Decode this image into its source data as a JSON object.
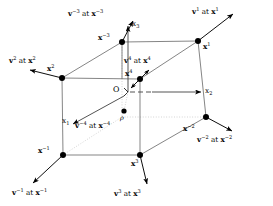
{
  "figure": {
    "background_color": "#ffffff",
    "line_color": "#000000",
    "dotted_color": "#bdbdbd",
    "node_color": "#000000"
  },
  "axes": [
    {
      "id": "x1",
      "label_text": "x",
      "label_sub": "1"
    },
    {
      "id": "x2",
      "label_text": "x",
      "label_sub": "2"
    },
    {
      "id": "x3",
      "label_text": "x",
      "label_sub": "3"
    }
  ],
  "origin": {
    "label": "O"
  },
  "position_vector": {
    "label": "ρ"
  },
  "nodes": [
    {
      "id": "n_x1",
      "base": "x",
      "exp": "1"
    },
    {
      "id": "n_x2",
      "base": "x",
      "exp": "2"
    },
    {
      "id": "n_x3",
      "base": "x",
      "exp": "3"
    },
    {
      "id": "n_x4",
      "base": "x",
      "exp": "4"
    },
    {
      "id": "n_xm1",
      "base": "x",
      "exp": "−1"
    },
    {
      "id": "n_xm2",
      "base": "x",
      "exp": "−2"
    },
    {
      "id": "n_xm3",
      "base": "x",
      "exp": "−3"
    }
  ],
  "vector_labels": [
    {
      "id": "v1",
      "vec": "v",
      "vec_exp": "1",
      "at": "at",
      "pt": "x",
      "pt_exp": "1"
    },
    {
      "id": "v2",
      "vec": "v",
      "vec_exp": "2",
      "at": "at",
      "pt": "x",
      "pt_exp": "2"
    },
    {
      "id": "v3",
      "vec": "v",
      "vec_exp": "3",
      "at": "at",
      "pt": "x",
      "pt_exp": "3"
    },
    {
      "id": "v4",
      "vec": "v",
      "vec_exp": "4",
      "at": "at",
      "pt": "x",
      "pt_exp": "4"
    },
    {
      "id": "vm1",
      "vec": "v",
      "vec_exp": "−1",
      "at": "at",
      "pt": "x",
      "pt_exp": "−1"
    },
    {
      "id": "vm2",
      "vec": "v",
      "vec_exp": "−2",
      "at": "at",
      "pt": "x",
      "pt_exp": "−2"
    },
    {
      "id": "vm3",
      "vec": "v",
      "vec_exp": "−3",
      "at": "at",
      "pt": "x",
      "pt_exp": "−3"
    },
    {
      "id": "vm4",
      "vec": "v",
      "vec_exp": "−4",
      "at": "at",
      "pt": "x",
      "pt_exp": "−4"
    }
  ],
  "text": {
    "axis_x1": "x",
    "axis_x1_sub": "1",
    "axis_x2": "x",
    "axis_x2_sub": "2",
    "axis_x3": "x",
    "axis_x3_sub": "3",
    "origin_label": "O",
    "rho_label": "ρ",
    "node_x1": "x",
    "node_x1_exp": "1",
    "node_x2": "x",
    "node_x2_exp": "2",
    "node_x3": "x",
    "node_x3_exp": "3",
    "node_x4": "x",
    "node_x4_exp": "4",
    "node_xm1": "x",
    "node_xm1_exp": "−1",
    "node_xm2": "x",
    "node_xm2_exp": "−2",
    "node_xm3": "x",
    "node_xm3_exp": "−3",
    "at_word": "at",
    "v1_vec": "v",
    "v1_exp": "1",
    "v1_pt": "x",
    "v1_pt_exp": "1",
    "v2_vec": "v",
    "v2_exp": "2",
    "v2_pt": "x",
    "v2_pt_exp": "2",
    "v3_vec": "v",
    "v3_exp": "3",
    "v3_pt": "x",
    "v3_pt_exp": "3",
    "v4_vec": "v",
    "v4_exp": "4",
    "v4_pt": "x",
    "v4_pt_exp": "4",
    "vm1_vec": "v",
    "vm1_exp": "−1",
    "vm1_pt": "x",
    "vm1_pt_exp": "−1",
    "vm2_vec": "v",
    "vm2_exp": "−2",
    "vm2_pt": "x",
    "vm2_pt_exp": "−2",
    "vm3_vec": "v",
    "vm3_exp": "−3",
    "vm3_pt": "x",
    "vm3_pt_exp": "−3",
    "vm4_vec": "v",
    "vm4_exp": "−4",
    "vm4_pt": "x",
    "vm4_pt_exp": "−4"
  }
}
